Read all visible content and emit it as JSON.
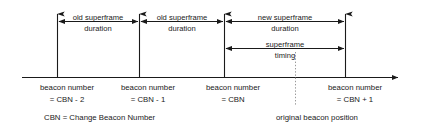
{
  "figure": {
    "type": "timing-diagram",
    "colors": {
      "line": "#1a1a1a",
      "text": "#1a1a1a",
      "dotted": "#9a9a9a",
      "background": "#ffffff"
    }
  },
  "spans": [
    {
      "id": "old-superframe-1",
      "line1": "old superframe",
      "line2": "duration",
      "from_beacon": "CBN - 2",
      "to_beacon": "CBN - 1"
    },
    {
      "id": "old-superframe-2",
      "line1": "old superframe",
      "line2": "duration",
      "from_beacon": "CBN - 1",
      "to_beacon": "CBN"
    },
    {
      "id": "new-superframe",
      "line1": "new superframe",
      "line2": "duration",
      "from_beacon": "CBN",
      "to_beacon": "CBN + 1"
    },
    {
      "id": "superframe-timing",
      "line1": "superframe",
      "line2": "timing",
      "from_beacon": "CBN",
      "to_beacon": "CBN + 1"
    }
  ],
  "beacons": [
    {
      "id": "beacon-cbn-minus-2",
      "line1": "beacon number",
      "line2": "= CBN - 2"
    },
    {
      "id": "beacon-cbn-minus-1",
      "line1": "beacon number",
      "line2": "= CBN - 1"
    },
    {
      "id": "beacon-cbn",
      "line1": "beacon number",
      "line2": "= CBN"
    },
    {
      "id": "beacon-cbn-plus-1",
      "line1": "beacon number",
      "line2": "= CBN + 1"
    }
  ],
  "annotations": {
    "legend": "CBN = Change Beacon Number",
    "original_beacon_position": "original beacon position"
  }
}
